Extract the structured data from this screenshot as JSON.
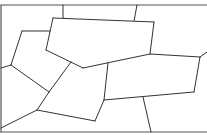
{
  "diagram": {
    "type": "voronoi-like-cell-partition",
    "width": 207,
    "height": 135,
    "background": "#ffffff",
    "stroke_color": "#333333",
    "frame_color": "#555555",
    "frame": [
      {
        "x1": 1,
        "y1": 5,
        "x2": 207,
        "y2": 5
      },
      {
        "x1": 1,
        "y1": 5,
        "x2": 1,
        "y2": 132
      },
      {
        "x1": 1,
        "y1": 132,
        "x2": 207,
        "y2": 132
      }
    ],
    "edges": [
      {
        "x1": 63,
        "y1": 5,
        "x2": 63,
        "y2": 18
      },
      {
        "x1": 137,
        "y1": 5,
        "x2": 134,
        "y2": 21
      },
      {
        "x1": 53,
        "y1": 18,
        "x2": 154,
        "y2": 22
      },
      {
        "x1": 154,
        "y1": 22,
        "x2": 150,
        "y2": 54
      },
      {
        "x1": 150,
        "y1": 54,
        "x2": 83,
        "y2": 68
      },
      {
        "x1": 83,
        "y1": 68,
        "x2": 46,
        "y2": 50
      },
      {
        "x1": 46,
        "y1": 50,
        "x2": 53,
        "y2": 18
      },
      {
        "x1": 22,
        "y1": 31,
        "x2": 50,
        "y2": 31
      },
      {
        "x1": 22,
        "y1": 31,
        "x2": 11,
        "y2": 65
      },
      {
        "x1": 11,
        "y1": 65,
        "x2": 1,
        "y2": 68
      },
      {
        "x1": 11,
        "y1": 65,
        "x2": 49,
        "y2": 92
      },
      {
        "x1": 49,
        "y1": 92,
        "x2": 71,
        "y2": 62
      },
      {
        "x1": 49,
        "y1": 92,
        "x2": 37,
        "y2": 110
      },
      {
        "x1": 37,
        "y1": 110,
        "x2": 1,
        "y2": 128
      },
      {
        "x1": 37,
        "y1": 110,
        "x2": 95,
        "y2": 121
      },
      {
        "x1": 95,
        "y1": 121,
        "x2": 104,
        "y2": 100
      },
      {
        "x1": 104,
        "y1": 100,
        "x2": 108,
        "y2": 63
      },
      {
        "x1": 150,
        "y1": 54,
        "x2": 200,
        "y2": 57
      },
      {
        "x1": 200,
        "y1": 57,
        "x2": 207,
        "y2": 52
      },
      {
        "x1": 200,
        "y1": 57,
        "x2": 194,
        "y2": 92
      },
      {
        "x1": 194,
        "y1": 92,
        "x2": 104,
        "y2": 100
      },
      {
        "x1": 143,
        "y1": 97,
        "x2": 151,
        "y2": 132
      }
    ]
  }
}
